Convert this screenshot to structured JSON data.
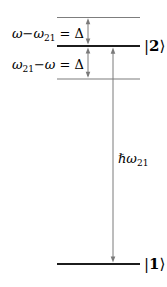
{
  "colors": {
    "background": "#ffffff",
    "level_line": "#1c1c1c",
    "virtual_level_line": "#7d7d7d",
    "arrow": "#7a7a7a",
    "text": "#000000"
  },
  "labels": {
    "upper_detuning": {
      "omega_expr": "ω−ω",
      "sub": "21",
      "eq": " = Δ"
    },
    "lower_detuning": {
      "omega": "ω",
      "sub": "21",
      "minus_omega": "−ω",
      "eq": " = Δ"
    },
    "transition_energy": {
      "hbar_omega": "ℏω",
      "sub": "21"
    },
    "level_2": {
      "bar": "|",
      "num": "2",
      "ket": "⟩"
    },
    "level_1": {
      "bar": "|",
      "num": "1",
      "ket": "⟩"
    }
  }
}
